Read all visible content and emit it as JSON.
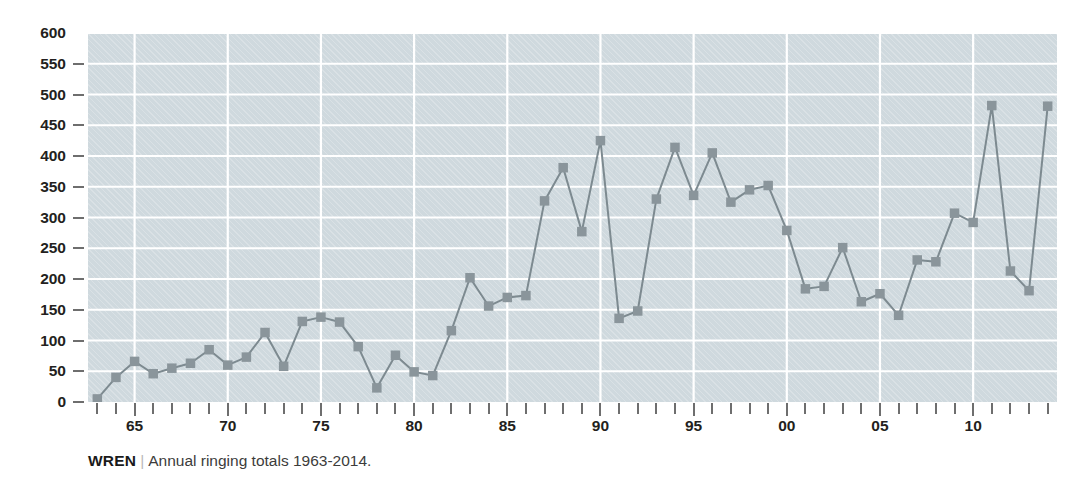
{
  "caption": {
    "species": "WREN",
    "separator": "|",
    "description": "Annual ringing totals 1963-2014."
  },
  "style": {
    "plot_background": "#cfd9de",
    "grid_color": "#ffffff",
    "series_color": "#7d8a90",
    "marker_color": "#8a959b",
    "axis_text_color": "#231f20",
    "tick_color": "#6e6e6e"
  },
  "chart_data": {
    "type": "line",
    "title": "",
    "subtitle": "",
    "xlabel": "",
    "ylabel": "",
    "xlim": [
      1962.5,
      2014.5
    ],
    "ylim": [
      0,
      600
    ],
    "grid": true,
    "legend": false,
    "legend_position": "none",
    "marker": "square",
    "y_ticks": [
      0,
      50,
      100,
      150,
      200,
      250,
      300,
      350,
      400,
      450,
      500,
      550,
      600
    ],
    "y_tick_labels": [
      "0",
      "50",
      "100",
      "150",
      "200",
      "250",
      "300",
      "350",
      "400",
      "450",
      "500",
      "550",
      "600"
    ],
    "x_ticks": [
      1963,
      1964,
      1965,
      1966,
      1967,
      1968,
      1969,
      1970,
      1971,
      1972,
      1973,
      1974,
      1975,
      1976,
      1977,
      1978,
      1979,
      1980,
      1981,
      1982,
      1983,
      1984,
      1985,
      1986,
      1987,
      1988,
      1989,
      1990,
      1991,
      1992,
      1993,
      1994,
      1995,
      1996,
      1997,
      1998,
      1999,
      2000,
      2001,
      2002,
      2003,
      2004,
      2005,
      2006,
      2007,
      2008,
      2009,
      2010,
      2011,
      2012,
      2013,
      2014
    ],
    "x_major_ticks": [
      1965,
      1970,
      1975,
      1980,
      1985,
      1990,
      1995,
      2000,
      2005,
      2010
    ],
    "x_major_labels": [
      "65",
      "70",
      "75",
      "80",
      "85",
      "90",
      "95",
      "00",
      "05",
      "10"
    ],
    "series_name": "Annual ringing totals",
    "x": [
      1963,
      1964,
      1965,
      1966,
      1967,
      1968,
      1969,
      1970,
      1971,
      1972,
      1973,
      1974,
      1975,
      1976,
      1977,
      1978,
      1979,
      1980,
      1981,
      1982,
      1983,
      1984,
      1985,
      1986,
      1987,
      1988,
      1989,
      1990,
      1991,
      1992,
      1993,
      1994,
      1995,
      1996,
      1997,
      1998,
      1999,
      2000,
      2001,
      2002,
      2003,
      2004,
      2005,
      2006,
      2007,
      2008,
      2009,
      2010,
      2011,
      2012,
      2013,
      2014
    ],
    "values": [
      5,
      40,
      66,
      46,
      55,
      63,
      85,
      60,
      73,
      113,
      58,
      131,
      138,
      130,
      90,
      23,
      76,
      49,
      43,
      116,
      202,
      156,
      170,
      173,
      327,
      381,
      277,
      425,
      136,
      148,
      330,
      414,
      336,
      405,
      325,
      345,
      352,
      279,
      184,
      188,
      251,
      163,
      176,
      141,
      231,
      228,
      307,
      292,
      482,
      213,
      181,
      481
    ]
  }
}
